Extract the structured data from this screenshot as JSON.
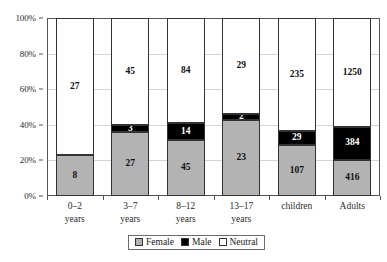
{
  "chart_data": {
    "type": "bar",
    "subtype": "stacked-100-percent",
    "title": "",
    "xlabel": "",
    "ylabel": "",
    "ylim": [
      0,
      100
    ],
    "ytick_labels": [
      "0%",
      "20%",
      "40%",
      "60%",
      "80%",
      "100%"
    ],
    "ytick_values": [
      0,
      20,
      40,
      60,
      80,
      100
    ],
    "grid": true,
    "legend_position": "bottom",
    "categories": [
      "0–2 years",
      "3–7 years",
      "8–12 years",
      "13–17 years",
      "children",
      "Adults"
    ],
    "category_lines": [
      [
        "0–2",
        "years"
      ],
      [
        "3–7",
        "years"
      ],
      [
        "8–12",
        "years"
      ],
      [
        "13–17",
        "years"
      ],
      [
        "children",
        ""
      ],
      [
        "Adults",
        ""
      ]
    ],
    "series": [
      {
        "name": "Female",
        "color": "#b3b3b3",
        "values": [
          8,
          27,
          45,
          23,
          107,
          416
        ]
      },
      {
        "name": "Male",
        "color": "#000000",
        "values": [
          0,
          3,
          14,
          2,
          29,
          384
        ]
      },
      {
        "name": "Neutral",
        "color": "#ffffff",
        "values": [
          27,
          45,
          84,
          29,
          235,
          1250
        ]
      }
    ],
    "totals": [
      35,
      75,
      143,
      54,
      371,
      2050
    ],
    "percent_series": [
      {
        "name": "Female",
        "values": [
          22.86,
          36.0,
          31.47,
          42.59,
          28.84,
          20.29
        ]
      },
      {
        "name": "Male",
        "values": [
          0.0,
          4.0,
          9.79,
          3.7,
          7.82,
          18.73
        ]
      },
      {
        "name": "Neutral",
        "values": [
          77.14,
          60.0,
          58.74,
          53.7,
          63.34,
          60.98
        ]
      }
    ],
    "data_labels": [
      {
        "category": "0–2 years",
        "female": "8",
        "male": "",
        "neutral": "27"
      },
      {
        "category": "3–7 years",
        "female": "27",
        "male": "3",
        "neutral": "45"
      },
      {
        "category": "8–12 years",
        "female": "45",
        "male": "14",
        "neutral": "84"
      },
      {
        "category": "13–17 years",
        "female": "23",
        "male": "2",
        "neutral": "29"
      },
      {
        "category": "children",
        "female": "107",
        "male": "29",
        "neutral": "235"
      },
      {
        "category": "Adults",
        "female": "416",
        "male": "384",
        "neutral": "1250"
      }
    ]
  },
  "legend": {
    "items": [
      {
        "label": "Female",
        "color": "#b3b3b3"
      },
      {
        "label": "Male",
        "color": "#000000"
      },
      {
        "label": "Neutral",
        "color": "#ffffff"
      }
    ]
  },
  "axis": {
    "y_labels": [
      "100%",
      "80%",
      "60%",
      "40%",
      "20%",
      "0%"
    ]
  }
}
